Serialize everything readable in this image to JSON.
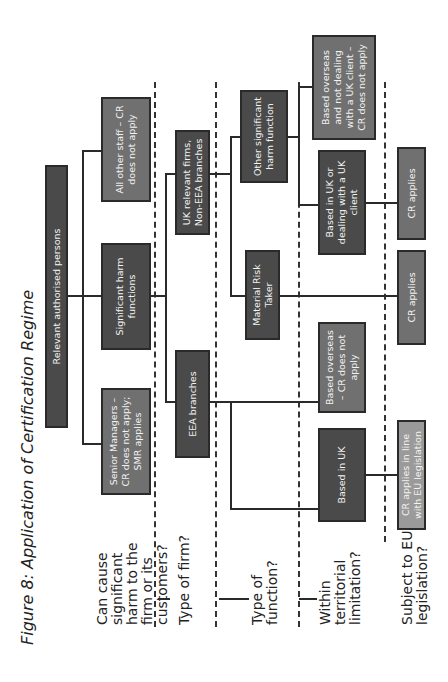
{
  "title": "Figure 8: Application of Certification Regime",
  "questions": [
    "Can cause significant harm to the firm or its customers?",
    "Type of firm?",
    "Type of function?",
    "Within territorial limitation?",
    "Subject to EU legislation?"
  ],
  "nodes": {
    "root": "Relevant authorised persons",
    "senior_managers": "Senior Managers – CR does not apply; SMR applies",
    "significant_harm": "Significant harm functions",
    "all_other_staff": "All other staff – CR does not apply",
    "eea_branches": "EEA branches",
    "uk_relevant_firms": "UK relevant firms, Non-EEA branches",
    "material_risk_taker": "Material Risk Taker",
    "other_significant_harm": "Other significant harm function",
    "based_in_uk": "Based in UK",
    "based_overseas_cr_not": "Based overseas – CR does not apply",
    "based_uk_or_dealing": "Based in UK or dealing with a UK client",
    "based_overseas_not_dealing": "Based overseas and not dealing with a UK client – CR does not apply",
    "cr_applies_eu": "CR applies in line with EU legislation",
    "cr_applies_1": "CR applies",
    "cr_applies_2": "CR applies"
  },
  "colors": {
    "dark_box": "#4a4a4a",
    "mid_box": "#707070",
    "light_box": "#9a9a9a"
  }
}
